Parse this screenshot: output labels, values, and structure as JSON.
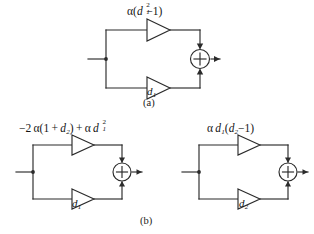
{
  "figure": {
    "background_color": "#ffffff",
    "line_color": "#2b2b2b",
    "text_color": "#141414"
  },
  "panels": [
    {
      "id": "panel-a",
      "caption": "(a)",
      "top_branch": {
        "gain_label_plain": "α(d₁²−1)",
        "parts": {
          "alpha": "α",
          "open_paren": "(",
          "d": "d",
          "sub": "1",
          "sup": "2",
          "minus_one": "−1",
          "close_paren": ")"
        }
      },
      "bottom_branch": {
        "gain_label_plain": "d₁",
        "parts": {
          "d": "d",
          "sub": "1"
        }
      },
      "summing_junction": {
        "symbol": "+",
        "top_input_sign": "+",
        "bottom_input_sign": "+"
      }
    },
    {
      "id": "panel-b-left",
      "caption": "",
      "top_branch": {
        "gain_label_plain": "−2 α(1 + d₂) + α d₁²",
        "parts": {
          "minus_two": "−2",
          "alpha": "α",
          "open_paren": "(",
          "one": "1",
          "plus": "+",
          "d_second": "d",
          "sub_second": "2",
          "close_paren": ")",
          "plus_outer": "+",
          "alpha_two": "α",
          "d_first": "d",
          "sub_first": "1",
          "sup_first": "2"
        }
      },
      "bottom_branch": {
        "gain_label_plain": "d₁",
        "parts": {
          "d": "d",
          "sub": "1"
        }
      },
      "summing_junction": {
        "symbol": "+",
        "top_input_sign": "+",
        "bottom_input_sign": "+"
      }
    },
    {
      "id": "panel-b-right",
      "caption": "",
      "top_branch": {
        "gain_label_plain": "α d₁(d₂ −1)",
        "parts": {
          "alpha": "α",
          "d_first": "d",
          "sub_first": "1",
          "open_paren": "(",
          "d_second": "d",
          "sub_second": "2",
          "minus_one": "−1",
          "close_paren": ")"
        }
      },
      "bottom_branch": {
        "gain_label_plain": "d₂",
        "parts": {
          "d": "d",
          "sub": "2"
        }
      },
      "summing_junction": {
        "symbol": "+",
        "top_input_sign": "+",
        "bottom_input_sign": "+"
      }
    }
  ],
  "captions": {
    "panel_a": "(a)",
    "panel_b": "(b)"
  }
}
